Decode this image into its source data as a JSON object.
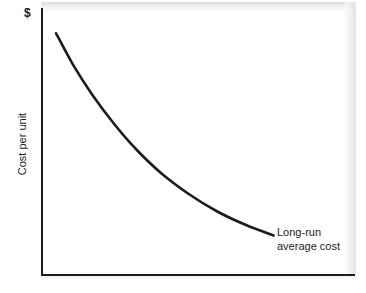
{
  "figure": {
    "name": "long-run-average-cost-curve",
    "background_color": "#ffffff",
    "ink_color": "#1c1c1c"
  },
  "chart_data": {
    "type": "line",
    "title": "",
    "subtitle": "",
    "xlabel": "",
    "ylabel": "Cost per unit",
    "y_unit_symbol": "$",
    "grid": false,
    "legend_position": "inline-annotation",
    "axis_ranges": {
      "x": [
        0,
        1
      ],
      "y": [
        0,
        1
      ]
    },
    "axis_tick_labels": {
      "x": [],
      "y": []
    },
    "annotations": [
      {
        "name": "long-run-average-cost-label",
        "text_lines": [
          "Long-run",
          "average cost"
        ],
        "text": "Long-run average cost",
        "points_to": {
          "x": 0.74,
          "y": 0.145
        }
      }
    ],
    "series": [
      {
        "name": "Long-run average cost",
        "color": "#1c1c1c",
        "line_width": 2.6,
        "x": [
          0.045,
          0.1,
          0.16,
          0.23,
          0.3,
          0.38,
          0.47,
          0.56,
          0.65,
          0.74
        ],
        "y": [
          0.905,
          0.785,
          0.675,
          0.565,
          0.47,
          0.38,
          0.3,
          0.235,
          0.185,
          0.145
        ]
      }
    ]
  },
  "labels": {
    "currency_symbol": "$",
    "y_axis_title": "Cost per unit",
    "annotation_line_1": "Long-run",
    "annotation_line_2": "average cost"
  }
}
